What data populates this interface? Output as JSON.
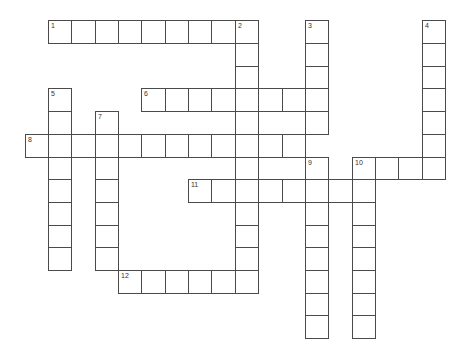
{
  "puzzle": {
    "type": "crossword",
    "grid_origin": {
      "x": 48,
      "y": 20.3
    },
    "cell_size": {
      "w": 23.35,
      "h": 22.7
    },
    "line_color": "#4a4a4a",
    "entries": [
      {
        "number": "1",
        "direction": "across",
        "row": 0,
        "col": 0,
        "length": 9
      },
      {
        "number": "2",
        "direction": "down",
        "row": 0,
        "col": 8,
        "length": 12
      },
      {
        "number": "3",
        "direction": "down",
        "row": 0,
        "col": 11,
        "length": 5
      },
      {
        "number": "4",
        "direction": "down",
        "row": 0,
        "col": 16,
        "length": 7
      },
      {
        "number": "5",
        "direction": "down",
        "row": 3,
        "col": 0,
        "length": 8
      },
      {
        "number": "6",
        "direction": "across",
        "row": 3,
        "col": 4,
        "length": 8
      },
      {
        "number": "7",
        "direction": "down",
        "row": 4,
        "col": 2,
        "length": 7
      },
      {
        "number": "8",
        "direction": "across",
        "row": 5,
        "col": -1,
        "length": 12
      },
      {
        "number": "9",
        "direction": "down",
        "row": 6,
        "col": 11,
        "length": 8
      },
      {
        "number": "10",
        "direction": "down",
        "row": 6,
        "col": 13,
        "length": 8
      },
      {
        "number": "10",
        "direction": "across",
        "row": 6,
        "col": 13,
        "length": 4
      },
      {
        "number": "11",
        "direction": "across",
        "row": 7,
        "col": 6,
        "length": 8
      },
      {
        "number": "12",
        "direction": "across",
        "row": 11,
        "col": 3,
        "length": 6
      }
    ]
  }
}
